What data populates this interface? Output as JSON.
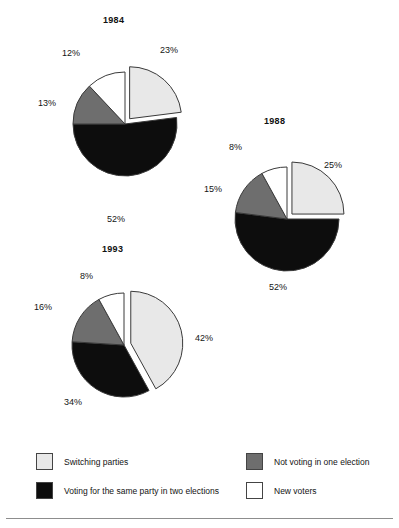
{
  "chart_data": {
    "type": "pie",
    "title": "",
    "subtitle": "",
    "xlabel": "",
    "ylabel": "",
    "legend_position": "bottom",
    "grid": false,
    "value_suffix": "%",
    "categories": [
      "Switching parties",
      "Voting for the same party in two elections",
      "Not voting in one election",
      "New voters"
    ],
    "colors": {
      "switching_parties": "#e8e8e8",
      "same_party": "#0d0d0d",
      "not_voting": "#6e6e6e",
      "new_voters": "#ffffff",
      "outline": "#3a3a3a",
      "background": "#ffffff",
      "rule": "#8d8d8d"
    },
    "charts": [
      {
        "title": "1984",
        "exploded_slice": "Switching parties",
        "slices": [
          {
            "label": "Switching parties",
            "value": 23,
            "value_label": "23%",
            "color_key": "switching_parties"
          },
          {
            "label": "Voting for the same party in two elections",
            "value": 52,
            "value_label": "52%",
            "color_key": "same_party"
          },
          {
            "label": "Not voting in one election",
            "value": 13,
            "value_label": "13%",
            "color_key": "not_voting"
          },
          {
            "label": "New voters",
            "value": 12,
            "value_label": "12%",
            "color_key": "new_voters"
          }
        ]
      },
      {
        "title": "1988",
        "exploded_slice": "Switching parties",
        "slices": [
          {
            "label": "Switching parties",
            "value": 25,
            "value_label": "25%",
            "color_key": "switching_parties"
          },
          {
            "label": "Voting for the same party in two elections",
            "value": 52,
            "value_label": "52%",
            "color_key": "same_party"
          },
          {
            "label": "Not voting in one election",
            "value": 15,
            "value_label": "15%",
            "color_key": "not_voting"
          },
          {
            "label": "New voters",
            "value": 8,
            "value_label": "8%",
            "color_key": "new_voters"
          }
        ]
      },
      {
        "title": "1993",
        "exploded_slice": "Switching parties",
        "slices": [
          {
            "label": "Switching parties",
            "value": 42,
            "value_label": "42%",
            "color_key": "switching_parties"
          },
          {
            "label": "Voting for the same party in two elections",
            "value": 34,
            "value_label": "34%",
            "color_key": "same_party"
          },
          {
            "label": "Not voting in one election",
            "value": 16,
            "value_label": "16%",
            "color_key": "not_voting"
          },
          {
            "label": "New voters",
            "value": 8,
            "value_label": "8%",
            "color_key": "new_voters"
          }
        ]
      }
    ]
  },
  "figure": {
    "pies": [
      {
        "id": "pie-1984",
        "title": "1984",
        "cx": 125,
        "cy": 124,
        "r": 52,
        "title_x": 103,
        "title_y": 15,
        "explode": 7,
        "labels": [
          {
            "text": "23%",
            "x": 160,
            "y": 45
          },
          {
            "text": "52%",
            "x": 107,
            "y": 214
          },
          {
            "text": "13%",
            "x": 38,
            "y": 98
          },
          {
            "text": "12%",
            "x": 62,
            "y": 48
          }
        ]
      },
      {
        "id": "pie-1988",
        "title": "1988",
        "cx": 287,
        "cy": 219,
        "r": 52,
        "title_x": 264,
        "title_y": 116,
        "explode": 7,
        "labels": [
          {
            "text": "25%",
            "x": 324,
            "y": 160
          },
          {
            "text": "52%",
            "x": 269,
            "y": 282
          },
          {
            "text": "15%",
            "x": 204,
            "y": 184
          },
          {
            "text": "8%",
            "x": 229,
            "y": 142
          }
        ]
      },
      {
        "id": "pie-1993",
        "title": "1993",
        "cx": 124,
        "cy": 345,
        "r": 52,
        "title_x": 102,
        "title_y": 244,
        "explode": 7,
        "labels": [
          {
            "text": "42%",
            "x": 195,
            "y": 333
          },
          {
            "text": "34%",
            "x": 64,
            "y": 397
          },
          {
            "text": "16%",
            "x": 34,
            "y": 302
          },
          {
            "text": "8%",
            "x": 80,
            "y": 271
          }
        ]
      }
    ],
    "legend": {
      "left_items": [
        {
          "label": "Switching parties",
          "color_key": "switching_parties"
        },
        {
          "label": "Voting for the same party in two elections",
          "color_key": "same_party"
        }
      ],
      "right_items": [
        {
          "label": "Not voting in one election",
          "color_key": "not_voting"
        },
        {
          "label": "New voters",
          "color_key": "new_voters"
        }
      ]
    }
  }
}
